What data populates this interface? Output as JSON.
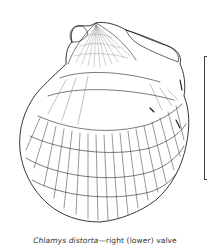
{
  "figure": {
    "caption": {
      "species": "Chlamys distorta",
      "separator": "—",
      "description": "right (lower) valve"
    },
    "illustration": {
      "subject": "scallop-shell-drawing",
      "style": "black ink line drawing on white"
    },
    "scale_bar": {
      "orientation": "vertical"
    }
  },
  "colors": {
    "background": "#ffffff",
    "ink": "#222222",
    "caption_text": "#333333"
  }
}
